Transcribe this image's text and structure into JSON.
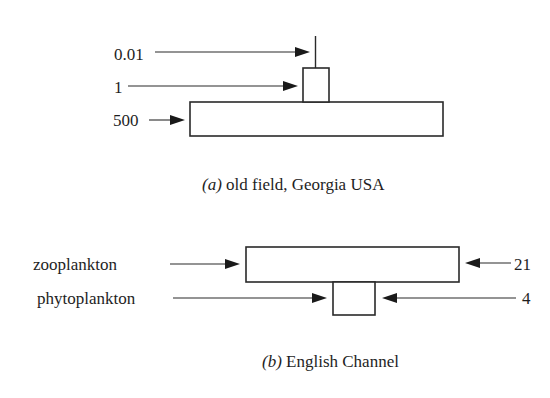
{
  "diagram_a": {
    "caption_tag": "(a)",
    "caption_text": " old field, Georgia USA",
    "levels": [
      {
        "name": "top",
        "label": "0.01"
      },
      {
        "name": "middle",
        "label": "1"
      },
      {
        "name": "bottom",
        "label": "500"
      }
    ]
  },
  "diagram_b": {
    "caption_tag": "(b)",
    "caption_text": " English Channel",
    "levels": [
      {
        "name": "zooplankton",
        "label": "zooplankton",
        "value": "21"
      },
      {
        "name": "phytoplankton",
        "label": "phytoplankton",
        "value": "4"
      }
    ]
  },
  "colors": {
    "ink": "#1e1e1e",
    "background": "#ffffff"
  }
}
